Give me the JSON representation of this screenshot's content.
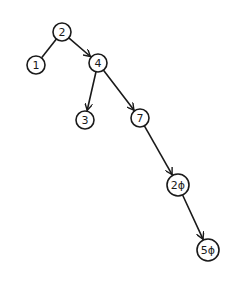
{
  "diagram": {
    "type": "binary-search-tree",
    "style": "hand-drawn",
    "colors": {
      "stroke": "#1a1a1a",
      "background": "#ffffff"
    },
    "nodes": [
      {
        "id": "n2",
        "label": "2",
        "x": 62,
        "y": 32,
        "r": 9
      },
      {
        "id": "n1",
        "label": "1",
        "x": 36,
        "y": 65,
        "r": 9
      },
      {
        "id": "n4",
        "label": "4",
        "x": 98,
        "y": 63,
        "r": 9
      },
      {
        "id": "n3",
        "label": "3",
        "x": 85,
        "y": 120,
        "r": 9
      },
      {
        "id": "n7",
        "label": "7",
        "x": 140,
        "y": 118,
        "r": 9
      },
      {
        "id": "n20",
        "label": "2ϕ",
        "x": 178,
        "y": 185,
        "r": 11
      },
      {
        "id": "n50",
        "label": "5ϕ",
        "x": 208,
        "y": 250,
        "r": 11
      }
    ],
    "edges": [
      {
        "from": "n2",
        "to": "n1",
        "arrow": false
      },
      {
        "from": "n2",
        "to": "n4",
        "arrow": true
      },
      {
        "from": "n4",
        "to": "n3",
        "arrow": true
      },
      {
        "from": "n4",
        "to": "n7",
        "arrow": true
      },
      {
        "from": "n7",
        "to": "n20",
        "arrow": true
      },
      {
        "from": "n20",
        "to": "n50",
        "arrow": true
      }
    ]
  }
}
